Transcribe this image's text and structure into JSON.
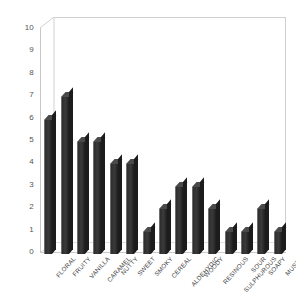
{
  "chart_data": {
    "type": "bar",
    "title": "",
    "subtitle": "",
    "xlabel": "",
    "ylabel": "",
    "ylim": [
      0,
      10
    ],
    "ytick_step": 1,
    "yticks": [
      "10",
      "9",
      "8",
      "7",
      "6",
      "5",
      "4",
      "3",
      "2",
      "1",
      "0"
    ],
    "grid": false,
    "legend": false,
    "legend_position": "none",
    "bar_color": "#3a3a3a",
    "plot_border_color": "#d0d0d0",
    "axis_color": "#c9c9c9",
    "tick_label_color": "#555555",
    "category_label_color": "#3d3d3d",
    "label_rotation_degrees": -48,
    "categories": [
      "FLORAL",
      "FRUITY",
      "VANILLA",
      "CARAMEL",
      "NUTTY",
      "SWEET",
      "SMOKY",
      "CEREAL",
      "ALDEHYDIC",
      "WOODY",
      "RESINOUS",
      "SULPHUROUS",
      "SOUR",
      "SOAPY",
      "MUSTY"
    ],
    "values": [
      6,
      7,
      5,
      5,
      4,
      4,
      1,
      2,
      3,
      3,
      2,
      1,
      1,
      2,
      1
    ]
  }
}
